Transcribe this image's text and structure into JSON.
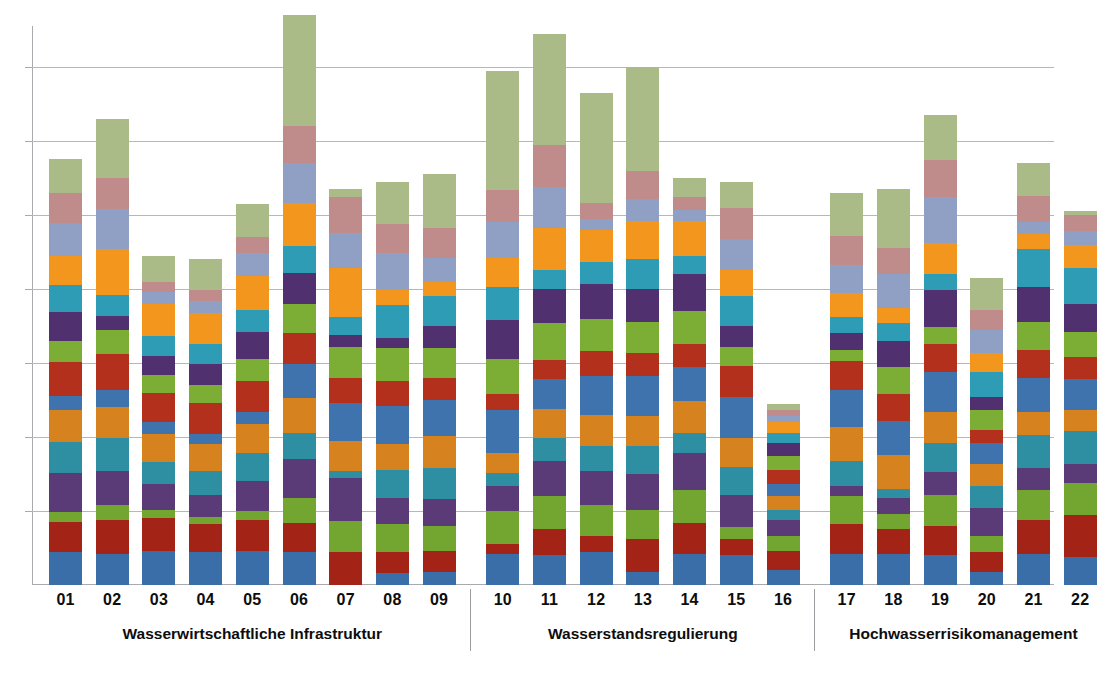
{
  "chart": {
    "type": "stacked-bar",
    "title": "",
    "xlabel": "",
    "ylabel": "",
    "grid": true,
    "legend": "none",
    "background": "#ffffff",
    "axis_color": "#a9a9ae",
    "grid_color": "#b6b6bb"
  },
  "chart_data": {
    "type": "bar",
    "stacked": true,
    "title": "",
    "xlabel": "",
    "ylabel": "",
    "grid": true,
    "legend_position": "none",
    "ylim": [
      0,
      7.55
    ],
    "y_gridline_values": [
      1,
      2,
      3,
      4,
      5,
      6,
      7
    ],
    "y_tick_labels": [],
    "categories": [
      "01",
      "02",
      "03",
      "04",
      "05",
      "06",
      "07",
      "08",
      "09",
      "10",
      "11",
      "12",
      "13",
      "14",
      "15",
      "16",
      "17",
      "18",
      "19",
      "20",
      "21",
      "22"
    ],
    "groups": [
      {
        "label": "Wasserwirtschaftliche Infrastruktur",
        "categories": [
          "01",
          "02",
          "03",
          "04",
          "05",
          "06",
          "07",
          "08",
          "09"
        ]
      },
      {
        "label": "Wasserstandsregulierung",
        "categories": [
          "10",
          "11",
          "12",
          "13",
          "14",
          "15",
          "16"
        ]
      },
      {
        "label": "Hochwasserrisikomanagement",
        "categories": [
          "17",
          "18",
          "19",
          "20",
          "21",
          "22"
        ]
      }
    ],
    "palette": {
      "blue": "#3a6ea8",
      "darkred": "#a32316",
      "green": "#73a531",
      "purple": "#5b3a78",
      "teal": "#2e8fa3",
      "orange": "#d5821f",
      "steelblue": "#3f73ad",
      "red": "#b3301d",
      "lightgreen": "#7cae36",
      "violet": "#50306e",
      "cyan": "#2f9cb5",
      "amber": "#f3961e",
      "periwinkle": "#8fa0c4",
      "rose": "#bf8b8b",
      "sage": "#aabb87"
    },
    "segment_order": [
      "blue",
      "darkred",
      "green",
      "purple",
      "teal",
      "orange",
      "steelblue",
      "red",
      "lightgreen",
      "violet",
      "cyan",
      "amber",
      "periwinkle",
      "rose",
      "sage"
    ],
    "totals": [
      5.75,
      6.3,
      4.45,
      4.4,
      5.55,
      6.7,
      5.35,
      5.45,
      5.55,
      6.95,
      7.45,
      6.15,
      7.0,
      5.5,
      5.25,
      2.45,
      5.3,
      4.85,
      6.35,
      3.95,
      5.7,
      5.05
    ],
    "series": [
      {
        "name": "blue",
        "color": "#3a6ea8",
        "values": [
          0.45,
          0.42,
          0.46,
          0.44,
          0.46,
          0.44,
          0.0,
          0.16,
          0.18,
          0.42,
          0.4,
          0.44,
          0.18,
          0.42,
          0.4,
          0.2,
          0.42,
          0.42,
          0.4,
          0.18,
          0.42,
          0.38
        ]
      },
      {
        "name": "darkred",
        "color": "#a32316",
        "values": [
          0.4,
          0.46,
          0.44,
          0.38,
          0.42,
          0.4,
          0.44,
          0.28,
          0.28,
          0.14,
          0.36,
          0.22,
          0.44,
          0.42,
          0.22,
          0.26,
          0.4,
          0.34,
          0.4,
          0.26,
          0.46,
          0.56
        ]
      },
      {
        "name": "green",
        "color": "#73a531",
        "values": [
          0.14,
          0.2,
          0.12,
          0.1,
          0.12,
          0.34,
          0.42,
          0.38,
          0.34,
          0.44,
          0.44,
          0.42,
          0.4,
          0.44,
          0.16,
          0.2,
          0.38,
          0.2,
          0.42,
          0.22,
          0.4,
          0.44
        ]
      },
      {
        "name": "purple",
        "color": "#5b3a78",
        "values": [
          0.52,
          0.46,
          0.34,
          0.3,
          0.4,
          0.52,
          0.58,
          0.36,
          0.36,
          0.34,
          0.48,
          0.46,
          0.48,
          0.5,
          0.44,
          0.22,
          0.14,
          0.22,
          0.3,
          0.38,
          0.3,
          0.26
        ]
      },
      {
        "name": "teal",
        "color": "#2e8fa3",
        "values": [
          0.42,
          0.44,
          0.3,
          0.32,
          0.38,
          0.36,
          0.1,
          0.38,
          0.42,
          0.18,
          0.3,
          0.34,
          0.38,
          0.28,
          0.38,
          0.14,
          0.34,
          0.12,
          0.4,
          0.3,
          0.44,
          0.44
        ]
      },
      {
        "name": "orange",
        "color": "#d5821f",
        "values": [
          0.44,
          0.42,
          0.38,
          0.36,
          0.4,
          0.46,
          0.4,
          0.34,
          0.44,
          0.26,
          0.4,
          0.42,
          0.4,
          0.42,
          0.38,
          0.18,
          0.46,
          0.46,
          0.42,
          0.3,
          0.32,
          0.28
        ]
      },
      {
        "name": "steelblue",
        "color": "#3f73ad",
        "values": [
          0.18,
          0.24,
          0.16,
          0.14,
          0.16,
          0.46,
          0.52,
          0.52,
          0.48,
          0.58,
          0.4,
          0.52,
          0.54,
          0.46,
          0.56,
          0.16,
          0.5,
          0.46,
          0.54,
          0.28,
          0.46,
          0.42
        ]
      },
      {
        "name": "red",
        "color": "#b3301d",
        "values": [
          0.46,
          0.48,
          0.4,
          0.42,
          0.42,
          0.42,
          0.34,
          0.34,
          0.3,
          0.22,
          0.26,
          0.34,
          0.32,
          0.32,
          0.42,
          0.2,
          0.38,
          0.36,
          0.38,
          0.18,
          0.38,
          0.3
        ]
      },
      {
        "name": "lightgreen",
        "color": "#7cae36",
        "values": [
          0.28,
          0.32,
          0.24,
          0.24,
          0.3,
          0.4,
          0.42,
          0.44,
          0.4,
          0.48,
          0.5,
          0.44,
          0.42,
          0.44,
          0.26,
          0.18,
          0.16,
          0.36,
          0.22,
          0.26,
          0.38,
          0.34
        ]
      },
      {
        "name": "violet",
        "color": "#50306e",
        "values": [
          0.4,
          0.2,
          0.26,
          0.28,
          0.36,
          0.42,
          0.16,
          0.14,
          0.3,
          0.52,
          0.46,
          0.46,
          0.44,
          0.5,
          0.28,
          0.18,
          0.22,
          0.36,
          0.5,
          0.18,
          0.46,
          0.38
        ]
      },
      {
        "name": "cyan",
        "color": "#2f9cb5",
        "values": [
          0.36,
          0.28,
          0.26,
          0.28,
          0.3,
          0.36,
          0.24,
          0.44,
          0.4,
          0.44,
          0.26,
          0.3,
          0.4,
          0.24,
          0.4,
          0.14,
          0.22,
          0.24,
          0.22,
          0.34,
          0.52,
          0.48
        ]
      },
      {
        "name": "amber",
        "color": "#f3961e",
        "values": [
          0.4,
          0.62,
          0.44,
          0.42,
          0.46,
          0.58,
          0.66,
          0.2,
          0.2,
          0.4,
          0.56,
          0.44,
          0.52,
          0.48,
          0.36,
          0.14,
          0.32,
          0.2,
          0.42,
          0.26,
          0.2,
          0.32
        ]
      },
      {
        "name": "periwinkle",
        "color": "#8fa0c4",
        "values": [
          0.44,
          0.54,
          0.16,
          0.16,
          0.3,
          0.54,
          0.48,
          0.5,
          0.32,
          0.48,
          0.56,
          0.14,
          0.3,
          0.14,
          0.42,
          0.08,
          0.38,
          0.46,
          0.62,
          0.3,
          0.16,
          0.18
        ]
      },
      {
        "name": "rose",
        "color": "#bf8b8b",
        "values": [
          0.4,
          0.42,
          0.14,
          0.14,
          0.22,
          0.5,
          0.48,
          0.4,
          0.4,
          0.44,
          0.56,
          0.22,
          0.38,
          0.18,
          0.42,
          0.08,
          0.4,
          0.36,
          0.5,
          0.28,
          0.36,
          0.22
        ]
      },
      {
        "name": "sage",
        "color": "#aabb87",
        "values": [
          0.46,
          0.8,
          0.35,
          0.42,
          0.45,
          1.5,
          0.11,
          0.57,
          0.73,
          1.61,
          1.51,
          1.49,
          1.4,
          0.26,
          0.35,
          0.09,
          0.58,
          0.79,
          0.61,
          0.43,
          0.44,
          0.05
        ]
      }
    ]
  }
}
